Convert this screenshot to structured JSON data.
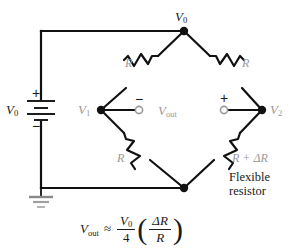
{
  "diagram": {
    "colors": {
      "wire": "#111111",
      "label_gray": "#9a9a9a",
      "label_black": "#1a1a1a",
      "background": "#ffffff"
    },
    "source": {
      "label": "V",
      "label_sub": "0",
      "plus_sign": "+",
      "minus_sign": "−",
      "symbol": "battery"
    },
    "ground": {
      "symbol": "earth-ground"
    },
    "nodes": [
      {
        "id": "top",
        "label": "V",
        "label_sub": "0"
      },
      {
        "id": "left",
        "label": "V",
        "label_sub": "1"
      },
      {
        "id": "right",
        "label": "V",
        "label_sub": "2"
      },
      {
        "id": "bottom",
        "label": "",
        "label_sub": ""
      }
    ],
    "resistors": [
      {
        "id": "top-left",
        "label": "R",
        "label_extra": ""
      },
      {
        "id": "top-right",
        "label": "R",
        "label_extra": ""
      },
      {
        "id": "bottom-left",
        "label": "R",
        "label_extra": ""
      },
      {
        "id": "bottom-right",
        "label": "R + ΔR",
        "label_extra": "Flexible resistor"
      }
    ],
    "output": {
      "label": "V",
      "label_sub": "out",
      "minus_terminal_sign": "−",
      "plus_terminal_sign": "+",
      "terminal_symbol": "open-circle"
    },
    "flexible_note": {
      "line1": "Flexible",
      "line2": "resistor"
    },
    "equation": {
      "lhs": "V",
      "lhs_sub": "out",
      "relation": "≈",
      "frac1_num": "V",
      "frac1_num_sub": "0",
      "frac1_den": "4",
      "paren_open": "(",
      "frac2_num": "ΔR",
      "frac2_den": "R",
      "paren_close": ")"
    }
  }
}
